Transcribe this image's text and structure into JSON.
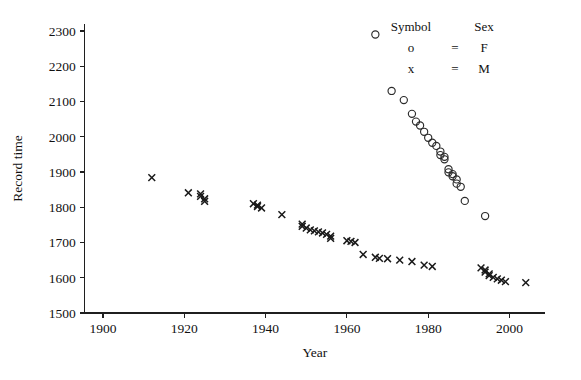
{
  "chart_data": {
    "type": "scatter",
    "title": "",
    "xlabel": "Year",
    "ylabel": "Record time",
    "xlim": [
      1895,
      2010
    ],
    "ylim": [
      1500,
      2330
    ],
    "grid": false,
    "xticks": [
      1900,
      1920,
      1940,
      1960,
      1980,
      2000
    ],
    "yticks": [
      1500,
      1600,
      1700,
      1800,
      1900,
      2000,
      2100,
      2200,
      2300
    ],
    "xtick_labels": [
      "1900",
      "1920",
      "1940",
      "1960",
      "1980",
      "2000"
    ],
    "ytick_labels": [
      "1500",
      "1600",
      "1700",
      "1800",
      "1900",
      "2000",
      "2100",
      "2200",
      "2300"
    ],
    "legend": {
      "position": "top-right",
      "header_symbol": "Symbol",
      "header_sex": "Sex",
      "equals": "=",
      "rows": [
        {
          "symbol": "o",
          "marker": "circle",
          "label": "F"
        },
        {
          "symbol": "x",
          "marker": "cross",
          "label": "M"
        }
      ]
    },
    "series": [
      {
        "name": "F",
        "marker": "circle",
        "color": "#2b2b2b",
        "points": [
          [
            1967,
            2290
          ],
          [
            1971,
            2130
          ],
          [
            1974,
            2104
          ],
          [
            1976,
            2065
          ],
          [
            1977,
            2043
          ],
          [
            1978,
            2032
          ],
          [
            1979,
            2014
          ],
          [
            1980,
            1997
          ],
          [
            1981,
            1983
          ],
          [
            1982,
            1974
          ],
          [
            1983,
            1958
          ],
          [
            1983,
            1948
          ],
          [
            1984,
            1943
          ],
          [
            1984,
            1936
          ],
          [
            1985,
            1908
          ],
          [
            1985,
            1899
          ],
          [
            1986,
            1894
          ],
          [
            1986,
            1888
          ],
          [
            1987,
            1879
          ],
          [
            1987,
            1867
          ],
          [
            1988,
            1858
          ],
          [
            1989,
            1818
          ],
          [
            1994,
            1775
          ]
        ]
      },
      {
        "name": "M",
        "marker": "cross",
        "color": "#1a1a1a",
        "points": [
          [
            1912,
            1884
          ],
          [
            1921,
            1841
          ],
          [
            1924,
            1838
          ],
          [
            1924,
            1831
          ],
          [
            1925,
            1824
          ],
          [
            1925,
            1817
          ],
          [
            1937,
            1810
          ],
          [
            1938,
            1806
          ],
          [
            1938,
            1802
          ],
          [
            1939,
            1798
          ],
          [
            1944,
            1779
          ],
          [
            1949,
            1752
          ],
          [
            1949,
            1746
          ],
          [
            1950,
            1741
          ],
          [
            1951,
            1736
          ],
          [
            1952,
            1733
          ],
          [
            1953,
            1730
          ],
          [
            1954,
            1727
          ],
          [
            1955,
            1723
          ],
          [
            1956,
            1718
          ],
          [
            1956,
            1712
          ],
          [
            1960,
            1705
          ],
          [
            1961,
            1703
          ],
          [
            1962,
            1700
          ],
          [
            1964,
            1666
          ],
          [
            1967,
            1658
          ],
          [
            1968,
            1655
          ],
          [
            1970,
            1654
          ],
          [
            1973,
            1650
          ],
          [
            1976,
            1646
          ],
          [
            1979,
            1636
          ],
          [
            1981,
            1632
          ],
          [
            1993,
            1628
          ],
          [
            1994,
            1622
          ],
          [
            1994,
            1616
          ],
          [
            1995,
            1611
          ],
          [
            1995,
            1606
          ],
          [
            1996,
            1601
          ],
          [
            1997,
            1597
          ],
          [
            1998,
            1593
          ],
          [
            1999,
            1589
          ],
          [
            2004,
            1586
          ]
        ]
      }
    ]
  }
}
